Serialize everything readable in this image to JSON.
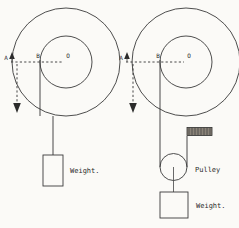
{
  "figure": {
    "background_color": "#fbfaf7",
    "line_color": "#3a3a3a",
    "label_color": "#2b2b2b"
  },
  "left_diagram": {
    "name": "wheel-and-axle-direct-load",
    "points": {
      "a_label": "A",
      "b_label": "B",
      "o_label": "O"
    },
    "weight_label": "Weight.",
    "outer_wheel": {
      "cx": 66,
      "cy": 62,
      "r": 54
    },
    "inner_axle": {
      "cx": 66,
      "cy": 62,
      "r": 26
    },
    "center_line_y": 62,
    "arrow_up_x": 12,
    "arrow_down_x": 17,
    "arrow_down_y": 110,
    "rope_x": 40,
    "rope_top_y": 62,
    "rope_bottom_y": 155,
    "weight_box": {
      "x": 43,
      "y": 155,
      "w": 20,
      "h": 31
    }
  },
  "right_diagram": {
    "name": "wheel-and-axle-with-pulley",
    "points": {
      "a_label": "A",
      "b_label": "B",
      "o_label": "O"
    },
    "pulley_label": "Pulley",
    "weight_label": "Weight.",
    "outer_wheel": {
      "cx": 186,
      "cy": 62,
      "r": 54
    },
    "inner_axle": {
      "cx": 186,
      "cy": 62,
      "r": 26
    },
    "center_line_y": 62,
    "arrow_up_x": 127,
    "arrow_down_x": 133,
    "arrow_down_y": 110,
    "rope_left_x": 160,
    "rope_right_x": 187,
    "anchor_block": {
      "x": 187,
      "y": 128,
      "w": 24,
      "h": 8
    },
    "pulley": {
      "cx": 173.5,
      "cy": 167,
      "r": 14
    },
    "weight_box": {
      "x": 161,
      "y": 192,
      "w": 27,
      "h": 26
    }
  }
}
